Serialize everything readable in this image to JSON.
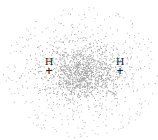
{
  "diagram": {
    "colors": {
      "background": "#ffffff",
      "dots": "#9a9a9a",
      "text": "#222222"
    },
    "cloud": {
      "center_x": 82,
      "center_y": 72,
      "core_radius_x": 28,
      "core_radius_y": 16,
      "outer_radius_x": 78,
      "outer_radius_y": 66
    },
    "atoms": [
      {
        "symbol": "H",
        "charge": "+",
        "x": 49,
        "y": 62
      },
      {
        "symbol": "H",
        "charge": "+",
        "x": 120,
        "y": 62
      }
    ]
  }
}
